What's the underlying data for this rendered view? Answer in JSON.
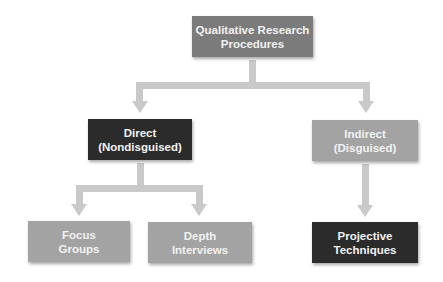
{
  "diagram": {
    "root": {
      "line1": "Qualitative Research",
      "line2": "Procedures"
    },
    "direct": {
      "line1": "Direct",
      "line2": "(Nondisguised)"
    },
    "indirect": {
      "line1": "Indirect",
      "line2": "(Disguised)"
    },
    "focus": {
      "line1": "Focus",
      "line2": "Groups"
    },
    "depth": {
      "line1": "Depth",
      "line2": "Interviews"
    },
    "projective": {
      "line1": "Projective",
      "line2": "Techniques"
    }
  },
  "colors": {
    "dark": "#2b2b2b",
    "mid": "#7b7b7b",
    "light": "#a3a3a3",
    "connector": "#c9c9c9"
  }
}
